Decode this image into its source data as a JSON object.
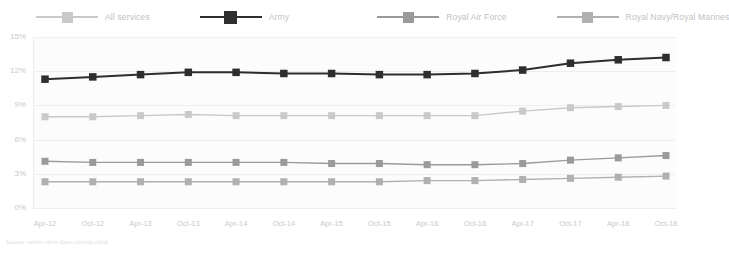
{
  "legend": {
    "position": "top",
    "items": [
      {
        "label": "All services",
        "color": "#c9c9c9",
        "marker": "square"
      },
      {
        "label": "Army",
        "color": "#2e2e2e",
        "marker": "square"
      },
      {
        "label": "Royal Air Force",
        "color": "#9a9a9a",
        "marker": "square"
      },
      {
        "label": "Royal Navy/Royal Marines",
        "color": "#b0b0b0",
        "marker": "square"
      }
    ]
  },
  "source": {
    "text": "Source: reform.uk/rn-Spec.com/sp.uk/uk"
  },
  "chart_data": {
    "type": "line",
    "title": "",
    "xlabel": "",
    "ylabel": "",
    "ylim": [
      0,
      15
    ],
    "yticks": [
      0,
      3,
      6,
      9,
      12,
      15
    ],
    "ytick_labels": [
      "0%",
      "3%",
      "6%",
      "9%",
      "12%",
      "15%"
    ],
    "grid": true,
    "legend_position": "top",
    "categories": [
      "Apr-12",
      "Oct-12",
      "Apr-13",
      "Oct-13",
      "Apr-14",
      "Oct-14",
      "Apr-15",
      "Oct-15",
      "Apr-16",
      "Oct-16",
      "Apr-17",
      "Oct-17",
      "Apr-18",
      "Oct-18"
    ],
    "series": [
      {
        "name": "All services",
        "color": "#c9c9c9",
        "values": [
          8.0,
          8.0,
          8.1,
          8.2,
          8.1,
          8.1,
          8.1,
          8.1,
          8.1,
          8.1,
          8.5,
          8.8,
          8.9,
          9.0
        ]
      },
      {
        "name": "Army",
        "color": "#2e2e2e",
        "values": [
          11.3,
          11.5,
          11.7,
          11.9,
          11.9,
          11.8,
          11.8,
          11.7,
          11.7,
          11.8,
          12.1,
          12.7,
          13.0,
          13.2
        ]
      },
      {
        "name": "Royal Air Force",
        "color": "#9a9a9a",
        "values": [
          4.1,
          4.0,
          4.0,
          4.0,
          4.0,
          4.0,
          3.9,
          3.9,
          3.8,
          3.8,
          3.9,
          4.2,
          4.4,
          4.6
        ]
      },
      {
        "name": "Royal Navy/Royal Marines",
        "color": "#b0b0b0",
        "values": [
          2.3,
          2.3,
          2.3,
          2.3,
          2.3,
          2.3,
          2.3,
          2.3,
          2.4,
          2.4,
          2.5,
          2.6,
          2.7,
          2.8
        ]
      }
    ]
  }
}
